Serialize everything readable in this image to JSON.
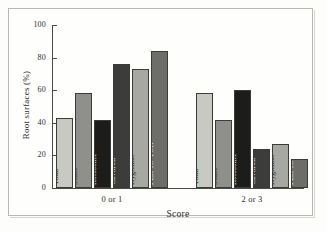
{
  "figure": {
    "background_color": "#fefefc",
    "frame_color": "#b9b7b1"
  },
  "axes": {
    "y_title": "Root surfaces (%)",
    "x_title": "Score",
    "y_ticks": [
      "0",
      "20",
      "40",
      "60",
      "80",
      "100"
    ],
    "y_min": 0,
    "y_max": 100,
    "group_labels": [
      "0 or 1",
      "2 or 3"
    ]
  },
  "chart_data": {
    "type": "bar",
    "title": "",
    "subtitle": "",
    "xlabel": "Score",
    "ylabel": "Root surfaces (%)",
    "ylim": [
      0,
      100
    ],
    "yticks": [
      0,
      20,
      40,
      60,
      80,
      100
    ],
    "grid": false,
    "legend": "none",
    "group_axis": "Score",
    "groups": [
      "0 or 1",
      "2 or 3"
    ],
    "categories": [
      "Titan",
      "Sonic",
      "Rotosonic",
      "Cavitron",
      "Hygienist",
      "PER-IO-TOR"
    ],
    "series": [
      {
        "name": "0 or 1",
        "values": [
          43,
          58,
          42,
          76,
          73,
          84
        ]
      },
      {
        "name": "2 or 3",
        "values": [
          58,
          42,
          60,
          24,
          27,
          18
        ]
      }
    ],
    "bars": [
      {
        "group": "0 or 1",
        "category": "Titan",
        "value": 43,
        "fill": "#c9c9c4",
        "text": "dark"
      },
      {
        "group": "0 or 1",
        "category": "Sonic",
        "value": 58,
        "fill": "#8f8f8b",
        "text": "dark"
      },
      {
        "group": "0 or 1",
        "category": "Rotosonic",
        "value": 42,
        "fill": "#1c1c1b",
        "text": "light"
      },
      {
        "group": "0 or 1",
        "category": "Cavitron",
        "value": 76,
        "fill": "#3c3c3a",
        "text": "light"
      },
      {
        "group": "0 or 1",
        "category": "Hygienist",
        "value": 73,
        "fill": "#a8a8a3",
        "text": "dark"
      },
      {
        "group": "0 or 1",
        "category": "PER-IO-TOR",
        "value": 84,
        "fill": "#6d6d69",
        "text": "light"
      },
      {
        "group": "2 or 3",
        "category": "Titan",
        "value": 58,
        "fill": "#c9c9c4",
        "text": "dark"
      },
      {
        "group": "2 or 3",
        "category": "Sonic",
        "value": 42,
        "fill": "#8f8f8b",
        "text": "dark"
      },
      {
        "group": "2 or 3",
        "category": "Rotosonic",
        "value": 60,
        "fill": "#1c1c1b",
        "text": "light"
      },
      {
        "group": "2 or 3",
        "category": "Cavitron",
        "value": 24,
        "fill": "#3c3c3a",
        "text": "light"
      },
      {
        "group": "2 or 3",
        "category": "Hygienist",
        "value": 27,
        "fill": "#a8a8a3",
        "text": "dark"
      },
      {
        "group": "2 or 3",
        "category": "PER-IO-TOR",
        "value": 18,
        "fill": "#6d6d69",
        "text": "light"
      }
    ]
  }
}
